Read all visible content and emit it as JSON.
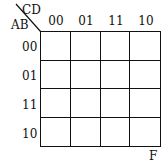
{
  "kmap": {
    "col_var": "CD",
    "row_var": "AB",
    "col_labels": [
      "00",
      "01",
      "11",
      "10"
    ],
    "row_labels": [
      "00",
      "01",
      "11",
      "10"
    ],
    "function_name": "F",
    "cells": [
      [
        "",
        "",
        "",
        ""
      ],
      [
        "",
        "",
        "",
        ""
      ],
      [
        "",
        "",
        "",
        ""
      ],
      [
        "",
        "",
        "",
        ""
      ]
    ]
  }
}
